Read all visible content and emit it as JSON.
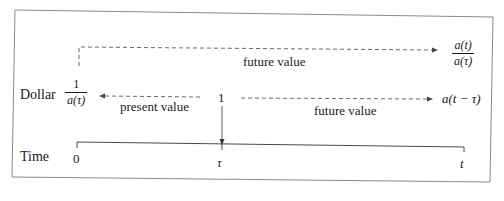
{
  "diagram": {
    "rows": {
      "dollar_label": "Dollar",
      "time_label": "Time"
    },
    "top_arrow": {
      "label": "future value",
      "result_numerator": "a(t)",
      "result_denominator": "a(τ)"
    },
    "left_arrow": {
      "label": "present value",
      "result_numerator": "1",
      "result_denominator": "a(τ)"
    },
    "right_arrow": {
      "label": "future value",
      "result": "a(t − τ)"
    },
    "origin_value": "1",
    "time_ticks": [
      "0",
      "τ",
      "t"
    ],
    "colors": {
      "line": "#333333",
      "border": "#888888",
      "background": "#ffffff"
    }
  }
}
